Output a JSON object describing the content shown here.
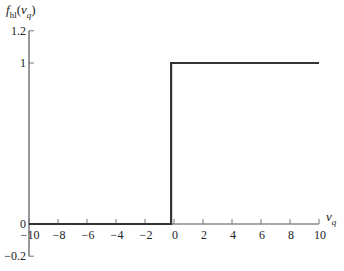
{
  "chart_data": {
    "type": "line",
    "title": "",
    "ylabel": "f_hl(v_q)",
    "ylabel_parts": {
      "f": "f",
      "sub": "hl",
      "open": "(",
      "v": "v",
      "vsub": "q",
      "close": ")"
    },
    "xlabel": "v_q",
    "xlabel_parts": {
      "v": "v",
      "sub": "q"
    },
    "xlim": [
      -10,
      10
    ],
    "ylim": [
      -0.2,
      1.2
    ],
    "grid": false,
    "legend": null,
    "x_ticks": [
      -10,
      -8,
      -6,
      -4,
      -2,
      0,
      2,
      4,
      6,
      8,
      10
    ],
    "x_tick_labels": [
      "−10",
      "−8",
      "−6",
      "−4",
      "−2",
      "0",
      "2",
      "4",
      "6",
      "8",
      "10"
    ],
    "y_ticks": [
      -0.2,
      0,
      1,
      1.2
    ],
    "y_tick_labels": [
      "−0.2",
      "0",
      "1",
      "1.2"
    ],
    "series": [
      {
        "name": "f_hl(v_q)",
        "description": "hard-limit step function",
        "x": [
          -10,
          -0.2,
          -0.2,
          10
        ],
        "y": [
          0,
          0,
          1,
          1
        ],
        "color": "#333333"
      }
    ]
  }
}
